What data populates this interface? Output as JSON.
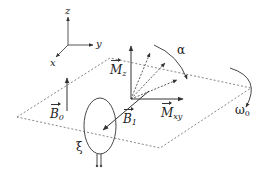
{
  "diagram": {
    "axes": {
      "z": "z",
      "y": "y",
      "x": "x"
    },
    "vectors": {
      "Mz": {
        "symbol": "M",
        "subscript": "z"
      },
      "Mxy": {
        "symbol": "M",
        "subscript": "xy"
      },
      "B0": {
        "symbol": "B",
        "subscript": "0"
      },
      "B1": {
        "symbol": "B",
        "subscript": "1"
      }
    },
    "angles": {
      "alpha": "α",
      "omega0": {
        "symbol": "ω",
        "subscript": "0"
      }
    },
    "coil": {
      "label": "ξ"
    },
    "colors": {
      "line": "#333333",
      "dashed": "#555555",
      "background": "#ffffff"
    }
  }
}
